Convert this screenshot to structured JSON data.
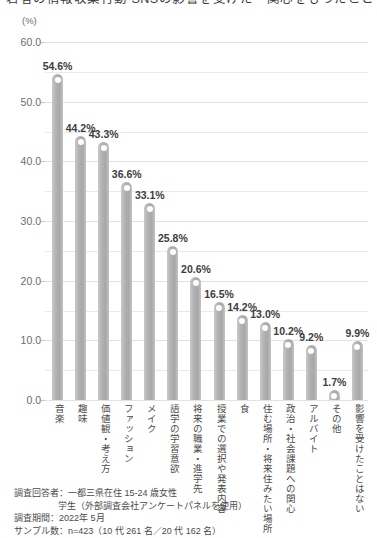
{
  "title": {
    "text": "若者の情報収集行動 SNSの影響を受けた・関心をもったこと"
  },
  "chart_data": {
    "type": "bar",
    "title": "",
    "xlabel": "",
    "ylabel": "(%)",
    "unit": "(%)",
    "ylim": [
      0,
      60
    ],
    "ytick_labels": [
      "0.0",
      "10.0",
      "20.0",
      "30.0",
      "40.0",
      "50.0",
      "60.0"
    ],
    "ytick_values": [
      0,
      10,
      20,
      30,
      40,
      50,
      60
    ],
    "minor_gridlines": [
      5,
      15,
      25,
      35,
      45,
      55
    ],
    "grid": true,
    "legend": "none",
    "categories": [
      "音楽",
      "趣味",
      "価値観・考え方",
      "ファッション",
      "メイク",
      "語学の学習意欲",
      "将来の職業・進学先",
      "授業での選択や発表内容",
      "食",
      "住む場所・将来住みたい場所",
      "政治・社会課題への関心",
      "アルバイト",
      "その他",
      "影響を受けたことはない"
    ],
    "values": [
      54.6,
      44.2,
      43.3,
      36.6,
      33.1,
      25.8,
      20.6,
      16.5,
      14.2,
      13.0,
      10.2,
      9.2,
      1.7,
      9.9
    ],
    "value_labels": [
      "54.6%",
      "44.2%",
      "43.3%",
      "36.6%",
      "33.1%",
      "25.8%",
      "20.6%",
      "16.5%",
      "14.2%",
      "13.0%",
      "10.2%",
      "9.2%",
      "1.7%",
      "9.9%"
    ],
    "bar_color": "#b2b2b2"
  },
  "footnotes": [
    "調査回答者：一都三県在住 15-24 歳女性",
    "学生（外部調査会社アンケートパネルを使用）",
    "調査期間：2022年 5月",
    "サンプル数：n=423（10 代 261 名／20 代 162 名）"
  ]
}
